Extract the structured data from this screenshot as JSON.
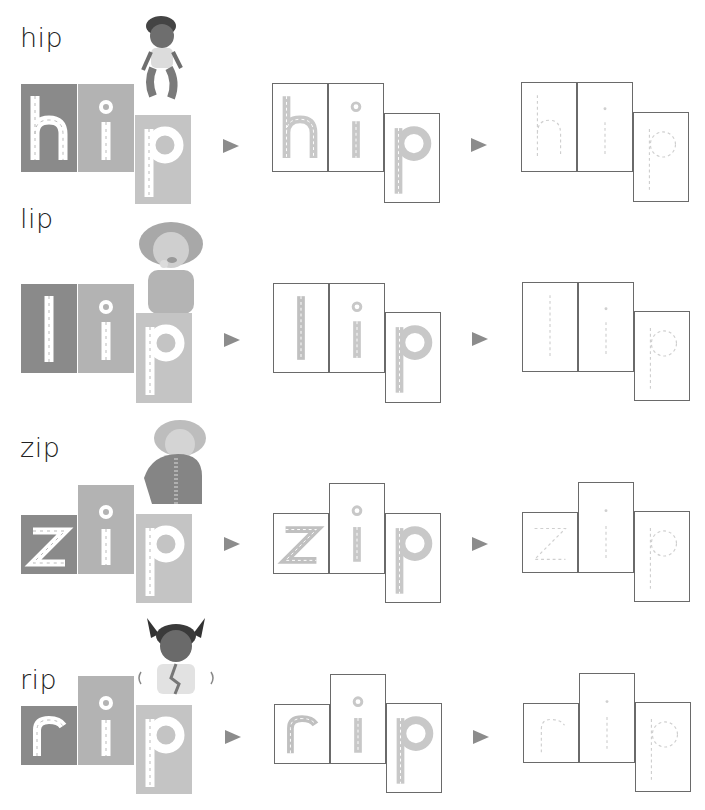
{
  "page": {
    "rows": [
      {
        "word": "hip",
        "letters": [
          "h",
          "i",
          "p"
        ],
        "character": "boy-squatting-touching-hips"
      },
      {
        "word": "lip",
        "letters": [
          "l",
          "i",
          "p"
        ],
        "character": "girl-touching-lip"
      },
      {
        "word": "zip",
        "letters": [
          "z",
          "i",
          "p"
        ],
        "character": "child-zipping-jacket"
      },
      {
        "word": "rip",
        "letters": [
          "r",
          "i",
          "p"
        ],
        "character": "girl-with-ripped-shirt"
      }
    ],
    "stages": [
      "solid-letters",
      "traced-letters",
      "dotted-letters"
    ],
    "arrow_icon": "triangle-right-icon",
    "colors": {
      "tile_dark": "#8a8a8a",
      "tile_mid": "#b3b3b3",
      "tile_light": "#c4c4c4",
      "trace_fill": "#c8c8c8",
      "dot_line": "#d0d0d0",
      "outline": "#6a6a6a",
      "arrow": "#8c8c8c"
    }
  }
}
